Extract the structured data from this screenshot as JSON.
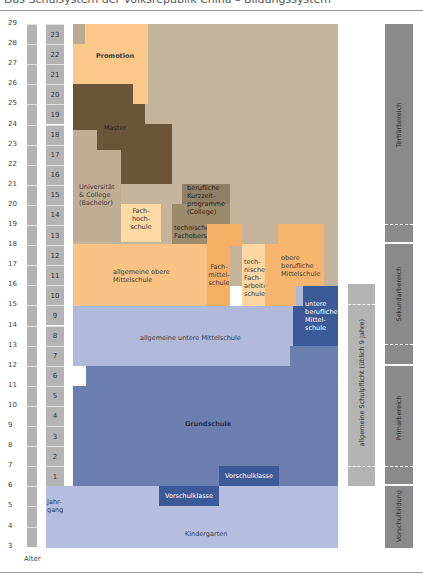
{
  "header": {
    "title": "Das Schulsystem der Volksrepublik China – Bildungssystem"
  },
  "axes": {
    "age_label": "Alter",
    "grade_label": "Jahr-\ngang",
    "ages": [
      "29",
      "28",
      "27",
      "26",
      "25",
      "24",
      "23",
      "22",
      "21",
      "20",
      "19",
      "18",
      "17",
      "16",
      "15",
      "14",
      "13",
      "12",
      "11",
      "10",
      "9",
      "8",
      "7",
      "6",
      "5",
      "4",
      "3"
    ],
    "grades": [
      "23",
      "22",
      "21",
      "20",
      "19",
      "18",
      "17",
      "16",
      "15",
      "14",
      "13",
      "12",
      "11",
      "10",
      "9",
      "8",
      "7",
      "6",
      "5",
      "4",
      "3",
      "2",
      "1"
    ]
  },
  "blocks": {
    "promotion": "Promotion",
    "master": "Master",
    "universitaet": "Universität\n& College\n(Bachelor)",
    "fachhochschule": "Fach-\nhoch-\nschule",
    "kurzzeit": "berufliche\nKurzzeit-\nprogramme\n(College)",
    "technische_fachoberschule": "technische\nFachoberschule",
    "allgemeine_obere": "allgemeine obere\nMittelschule",
    "fachmittelschule": "Fach-\nmittel-\nschule",
    "technische_facharbeiter": "tech-\nnische\nFach-\narbeiter-\nschule",
    "obere_berufliche": "obere\nberufliche\nMittelschule",
    "untere_berufliche": "untere\nberufliche\nMittel-\nschule",
    "allgemeine_untere": "allgemeine untere Mittelschule",
    "grundschule": "Grundschule",
    "vorschulklasse_1": "Vorschulklasse",
    "vorschulklasse_2": "Vorschulklasse",
    "kindergarten": "Kindergarten"
  },
  "side_bars": {
    "schulpflicht": "allgemeine Schulpflicht (üblich 9 Jahre)",
    "tertiaer": "Tertiärbereich",
    "sekundar": "Sekundarbereich",
    "primar": "Primarbereich",
    "vorschul": "Vorschulbildung"
  },
  "colors": {
    "tertiary_bg": "#c3b49b",
    "promotion": "#fcc88a",
    "master": "#6b5538",
    "uni": "#bfae94",
    "fachhochschule": "#fdd9a3",
    "kurzzeit": "#8f7f64",
    "tech_fachober": "#9b8a6c",
    "obere_mittel": "#fcc285",
    "fachmittel": "#f6ae64",
    "tech_facharbeiter": "#fdd6a4",
    "obere_beruf": "#f8b56e",
    "untere_mittel": "#b1b9da",
    "untere_beruf": "#3d5a98",
    "grundschule": "#6a7eb0",
    "vorschulklasse": "#3d5a98",
    "kindergarten": "#b6bedf",
    "bar_gray": "#b3b3b3",
    "bar_dark": "#8a8a8a"
  }
}
